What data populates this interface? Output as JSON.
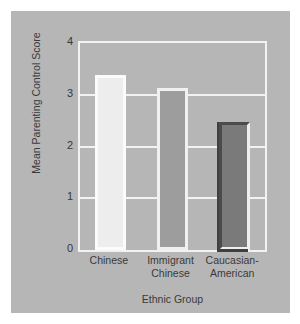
{
  "chart_data": {
    "type": "bar",
    "title": "",
    "subtitle": "",
    "xlabel": "Ethnic Group",
    "ylabel": "Mean Parenting Control Score",
    "categories": [
      "Chinese",
      "Immigrant Chinese",
      "Caucasian-American"
    ],
    "category_lines": [
      [
        "Chinese"
      ],
      [
        "Immigrant",
        "Chinese"
      ],
      [
        "Caucasian-",
        "American"
      ]
    ],
    "values": [
      3.38,
      3.13,
      2.47
    ],
    "ylim": [
      0,
      4
    ],
    "yticks": [
      "0",
      "1",
      "2",
      "3",
      "4"
    ],
    "ytick_values": [
      0,
      1,
      2,
      3,
      4
    ],
    "grid": true,
    "grid_axis": "y",
    "legend": "none",
    "annotations": [],
    "bar_styles": [
      "light",
      "mid",
      "dark"
    ],
    "colors": {
      "figure_background": "#ffffff",
      "panel_background": "#b6b6b6",
      "gridline": "#f2f2f2",
      "frame": "#f2f2f2",
      "bar_light_fill": "#ededed",
      "bar_mid_fill": "#9d9d9d",
      "bar_dark_fill": "#7a7a7a",
      "bar_highlight": "#fbfbfb",
      "bar_shadow": "#3f3f3f",
      "text": "#3a3a3a"
    }
  }
}
